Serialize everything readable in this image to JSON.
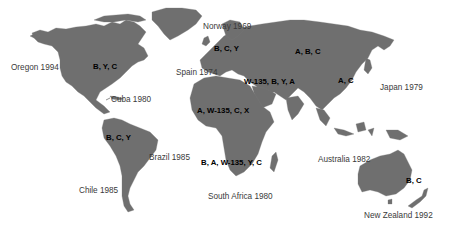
{
  "map": {
    "land_color": "#6f6f6f",
    "background_color": "#ffffff",
    "race_labels": [
      {
        "id": "north-america",
        "text": "B, Y, C",
        "x": 93,
        "y": 62
      },
      {
        "id": "europe",
        "text": "B, C, Y",
        "x": 214,
        "y": 47
      },
      {
        "id": "russia-asia",
        "text": "A, B, C",
        "x": 295,
        "y": 45
      },
      {
        "id": "middle-east",
        "text": "W-135, B, Y, A",
        "x": 244,
        "y": 76
      },
      {
        "id": "china",
        "text": "A, C",
        "x": 338,
        "y": 75
      },
      {
        "id": "north-africa",
        "text": "A, W-135, C, X",
        "x": 197,
        "y": 106
      },
      {
        "id": "south-america",
        "text": "B, C, Y",
        "x": 106,
        "y": 133
      },
      {
        "id": "southern-africa",
        "text": "B, A, W-135, Y, C",
        "x": 201,
        "y": 156
      },
      {
        "id": "australia",
        "text": "B, C",
        "x": 406,
        "y": 175
      }
    ],
    "place_labels": [
      {
        "id": "norway",
        "text": "Norway 1969",
        "x": 203,
        "y": 22
      },
      {
        "id": "oregon",
        "text": "Oregon 1994",
        "x": 11,
        "y": 62
      },
      {
        "id": "spain",
        "text": "Spain 1974",
        "x": 176,
        "y": 68
      },
      {
        "id": "cuba",
        "text": "Cuba 1980",
        "x": 111,
        "y": 94
      },
      {
        "id": "japan",
        "text": "Japan 1979",
        "x": 380,
        "y": 82
      },
      {
        "id": "brazil",
        "text": "Brazil 1985",
        "x": 149,
        "y": 152
      },
      {
        "id": "chile",
        "text": "Chile 1985",
        "x": 79,
        "y": 185
      },
      {
        "id": "australia",
        "text": "Australia 1982",
        "x": 318,
        "y": 154
      },
      {
        "id": "south-africa",
        "text": "South Africa 1980",
        "x": 208,
        "y": 192
      },
      {
        "id": "new-zealand",
        "text": "New Zealand 1992",
        "x": 364,
        "y": 210
      }
    ]
  },
  "race_text": {
    "north-america": "B, Y, C",
    "europe": "B, C, Y",
    "russia-asia": "A, B, C",
    "middle-east": "W-135, B, Y, A",
    "china": "A, C",
    "north-africa": "A, W-135, C, X",
    "south-america": "B, C, Y",
    "southern-africa": "B, A, W-135, Y, C",
    "australia": "B, C"
  },
  "place_text": {
    "norway": "Norway 1969",
    "oregon": "Oregon 1994",
    "spain": "Spain 1974",
    "cuba": "Cuba 1980",
    "japan": "Japan 1979",
    "brazil": "Brazil 1985",
    "chile": "Chile 1985",
    "australia": "Australia 1982",
    "south-africa": "South Africa 1980",
    "new-zealand": "New Zealand 1992"
  }
}
